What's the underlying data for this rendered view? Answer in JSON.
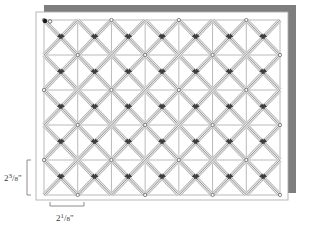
{
  "figure": {
    "type": "quilting-pattern-diagram",
    "panel": {
      "x": 36,
      "y": 12,
      "width": 252,
      "height": 188,
      "fill": "#ffffff",
      "border_color": "#b5b5b5",
      "inner_margin": 5
    },
    "shadow": {
      "color": "#8c8c8c",
      "offset_x": 8,
      "offset_y": -7,
      "edge_color": "#707070"
    },
    "grid": {
      "columns": 7,
      "rows": 5,
      "line_color": "#8a8a8a",
      "line_width": 0.6,
      "x": 44,
      "y": 20,
      "width": 236,
      "height": 175,
      "cell_width": 33.71,
      "cell_height": 35.0
    },
    "stitch_lines": {
      "color": "#4a4a4a",
      "highlight_color": "#e8e8e8",
      "line_width": 0.55,
      "band_width": 3.2,
      "direction_up_label": "diagonal-up-right",
      "direction_down_label": "diagonal-down-right"
    },
    "start_point": {
      "x": 45,
      "y": 21,
      "color": "#1a1a1a",
      "radius": 2.2,
      "label": "start-point"
    },
    "arrow_marker": {
      "color": "#3c3c3c",
      "size": 3.4,
      "label": "stitch-direction-arrow"
    },
    "node_dot": {
      "color": "#5a5a5a",
      "radius": 1.6
    }
  },
  "dimensions": {
    "vertical": {
      "whole": "2",
      "numerator": "3",
      "denominator": "8",
      "unit": "\"",
      "text": "2 3/8\"",
      "bracket": {
        "x": 27,
        "y": 160,
        "height": 35,
        "arm": 4,
        "color": "#6e6e6e"
      }
    },
    "horizontal": {
      "whole": "2",
      "numerator": "1",
      "denominator": "8",
      "unit": "\"",
      "text": "2 1/8\"",
      "bracket": {
        "x": 50,
        "y": 206,
        "width": 34,
        "arm": 4,
        "color": "#6e6e6e"
      }
    }
  },
  "chart_data": {
    "type": "diagram",
    "grid_columns": 7,
    "grid_rows": 5,
    "cell_size_horizontal_in": 2.125,
    "cell_size_vertical_in": 2.375,
    "labels": [
      "2 3/8\"",
      "2 1/8\""
    ]
  }
}
